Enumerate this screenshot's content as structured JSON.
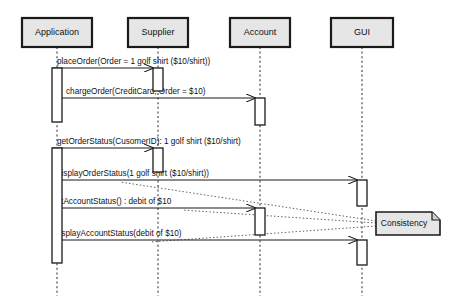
{
  "diagram": {
    "type": "uml-sequence-diagram",
    "width": 454,
    "height": 306,
    "background": "#ffffff",
    "line_color": "#1a1a1a",
    "box_fill": "#e6e6e6",
    "note_fill": "#e6e6e6"
  },
  "lifelines": [
    {
      "id": "application",
      "label": "Application",
      "x": 57,
      "box_x": 22,
      "box_y": 18,
      "box_w": 70,
      "box_h": 29
    },
    {
      "id": "supplier",
      "label": "Supplier",
      "x": 158,
      "box_x": 128,
      "box_y": 18,
      "box_w": 60,
      "box_h": 29
    },
    {
      "id": "account",
      "label": "Account",
      "x": 260,
      "box_x": 230,
      "box_y": 18,
      "box_w": 60,
      "box_h": 29
    },
    {
      "id": "gui",
      "label": "GUI",
      "x": 362,
      "box_x": 331,
      "box_y": 18,
      "box_w": 62,
      "box_h": 29
    }
  ],
  "lifeline_bottom": 296,
  "activations": [
    {
      "id": "act-application-1",
      "lifeline": "application",
      "x": 52,
      "y": 68,
      "w": 10,
      "h": 54
    },
    {
      "id": "act-application-2",
      "lifeline": "application",
      "x": 52,
      "y": 148,
      "w": 10,
      "h": 115
    },
    {
      "id": "act-supplier-1",
      "lifeline": "supplier",
      "x": 153,
      "y": 68,
      "w": 10,
      "h": 23
    },
    {
      "id": "act-supplier-2",
      "lifeline": "supplier",
      "x": 153,
      "y": 148,
      "w": 10,
      "h": 24
    },
    {
      "id": "act-account-1",
      "lifeline": "account",
      "x": 255,
      "y": 98,
      "w": 10,
      "h": 27
    },
    {
      "id": "act-account-2",
      "lifeline": "account",
      "x": 255,
      "y": 208,
      "w": 10,
      "h": 27
    },
    {
      "id": "act-gui-1",
      "lifeline": "gui",
      "x": 357,
      "y": 180,
      "w": 10,
      "h": 26
    },
    {
      "id": "act-gui-2",
      "lifeline": "gui",
      "x": 357,
      "y": 240,
      "w": 10,
      "h": 25
    }
  ],
  "messages": [
    {
      "id": "msg-place-order",
      "label": "placeOrder(Order = 1 golf shirt ($10/shirt))",
      "from": "application",
      "to": "supplier",
      "x1": 52,
      "x2": 153,
      "y": 68,
      "label_x": 57,
      "label_y": 64
    },
    {
      "id": "msg-charge-order",
      "label": "chargeOrder(CreditCard, Order = $10)",
      "from": "application",
      "to": "account",
      "x1": 62,
      "x2": 255,
      "y": 98,
      "label_x": 66,
      "label_y": 94
    },
    {
      "id": "msg-get-order-status",
      "label": "getOrderStatus(CusomerID): 1 golf shirt ($10/shirt)",
      "from": "application",
      "to": "supplier",
      "x1": 52,
      "x2": 153,
      "y": 148,
      "label_x": 57,
      "label_y": 144
    },
    {
      "id": "msg-display-order-status",
      "label": "displayOrderStatus(1 golf shirt ($10/shirt))",
      "from": "application",
      "to": "gui",
      "x1": 62,
      "x2": 357,
      "y": 180,
      "label_x": 57,
      "label_y": 176
    },
    {
      "id": "msg-get-account-status",
      "label": "getAccountStatus() : debit of $10",
      "from": "application",
      "to": "account",
      "x1": 62,
      "x2": 255,
      "y": 208,
      "label_x": 52,
      "label_y": 204
    },
    {
      "id": "msg-display-account-status",
      "label": "displayAccountStatus(debit of $10)",
      "from": "application",
      "to": "gui",
      "x1": 62,
      "x2": 357,
      "y": 240,
      "label_x": 55,
      "label_y": 236
    }
  ],
  "note": {
    "id": "note-consistency",
    "label": "Consistency",
    "x": 376,
    "y": 212,
    "w": 64,
    "h": 23,
    "fold": 8
  },
  "note_links": [
    {
      "id": "note-link-display-order-status",
      "x1": 376,
      "y1": 221,
      "x2": 120,
      "y2": 182
    },
    {
      "id": "note-link-get-account-status",
      "x1": 376,
      "y1": 223,
      "x2": 182,
      "y2": 210
    },
    {
      "id": "note-link-display-account-status",
      "x1": 376,
      "y1": 226,
      "x2": 150,
      "y2": 242
    }
  ]
}
